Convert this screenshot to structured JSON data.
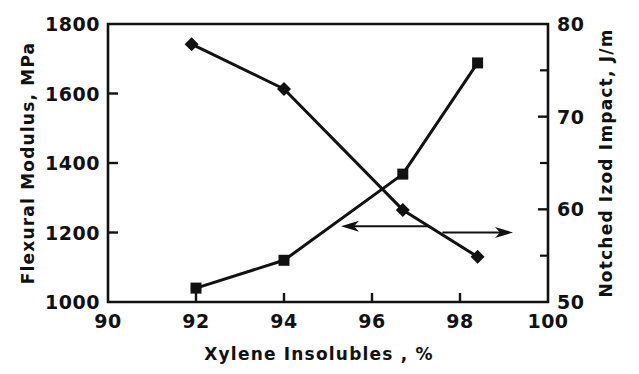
{
  "chart_data": {
    "type": "line",
    "title": "",
    "xlabel": "Xylene Insolubles , %",
    "ylabel": "Flexural Modulus, MPa",
    "y2label": "Notched Izod Impact, J/m",
    "xlim": [
      90,
      100
    ],
    "ylim": [
      1000,
      1800
    ],
    "y2lim": [
      50,
      80
    ],
    "grid": false,
    "legend": "none",
    "xticks": [
      "90",
      "92",
      "94",
      "96",
      "98",
      "100"
    ],
    "xtick_values": [
      90,
      92,
      94,
      96,
      98,
      100
    ],
    "yticks": [
      "1000",
      "1200",
      "1400",
      "1600",
      "1800"
    ],
    "ytick_values": [
      1000,
      1200,
      1400,
      1600,
      1800
    ],
    "y2ticks": [
      "50",
      "60",
      "70",
      "80"
    ],
    "y2tick_values": [
      50,
      60,
      70,
      80
    ],
    "y2_minor_tick_values": [
      55,
      65,
      75
    ],
    "series": [
      {
        "name": "Flexural Modulus, MPa",
        "axis": "left",
        "marker": "diamond",
        "x": [
          91.9,
          94.0,
          96.7,
          98.4
        ],
        "values": [
          1742,
          1613,
          1265,
          1130
        ]
      },
      {
        "name": "Notched Izod Impact, J/m",
        "axis": "right",
        "marker": "square",
        "x": [
          92.0,
          94.0,
          96.7,
          98.4
        ],
        "values": [
          51.5,
          54.5,
          63.8,
          75.8
        ]
      }
    ],
    "annotations": [
      {
        "name": "left-arrow",
        "label": "",
        "direction": "left",
        "x_start": 97.3,
        "x_end": 95.5,
        "y_left": 1218
      },
      {
        "name": "right-arrow",
        "label": "",
        "direction": "right",
        "x_start": 97.6,
        "x_end": 99.0,
        "y_right": 57.5
      }
    ]
  }
}
